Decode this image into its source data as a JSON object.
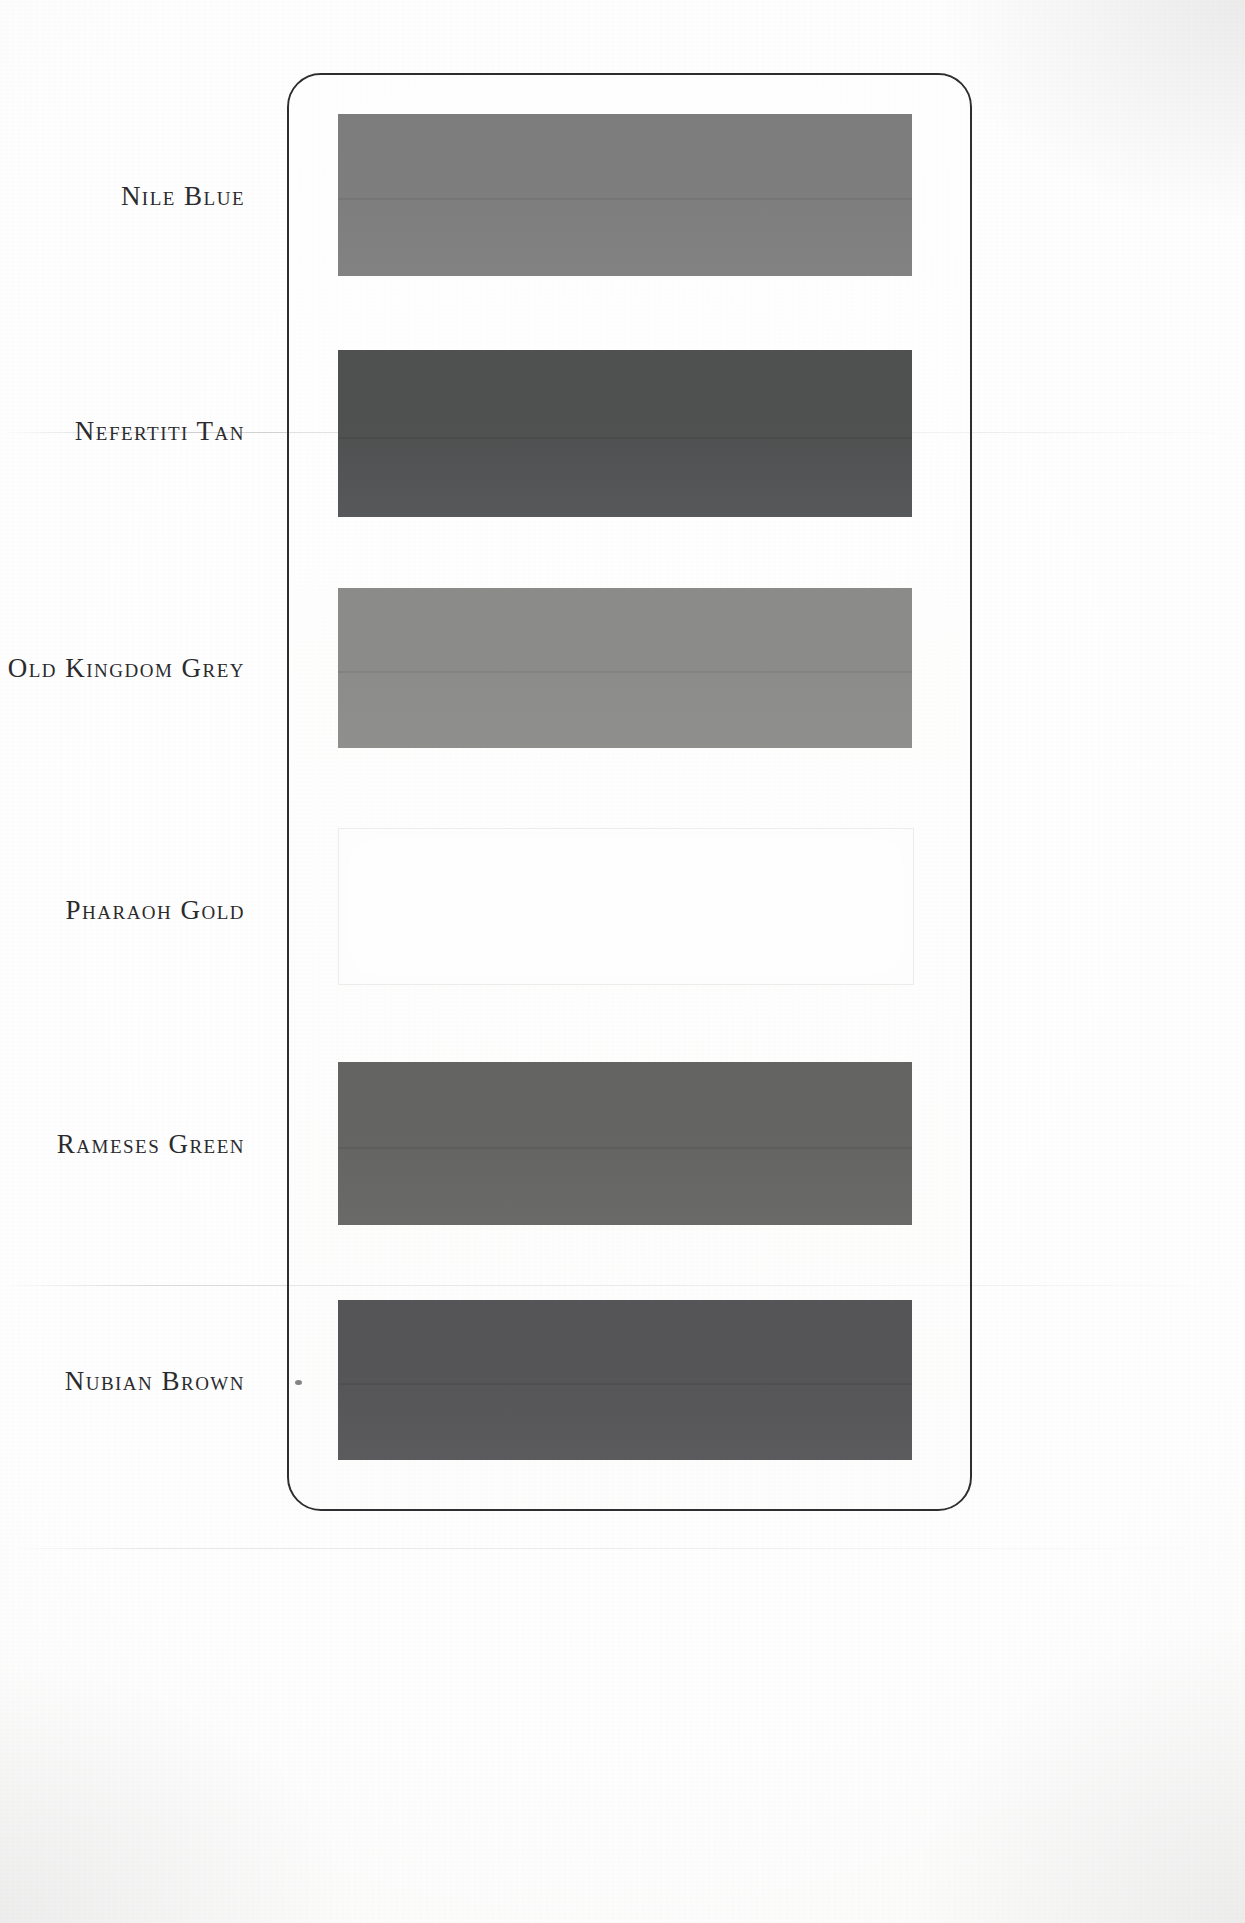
{
  "document": {
    "type": "paint-colour-sample-card",
    "title": "Egyptian Heritage Colour Card",
    "background_color": "#fdfdfc",
    "card": {
      "border_color": "#2e2e30",
      "corner_radius": 34,
      "x": 287,
      "y": 73,
      "width": 685,
      "height": 1438
    }
  },
  "swatches": [
    {
      "name": "Nile Blue",
      "label": "Nile Blue",
      "color": "#7d7d7e",
      "color_bottom": "#828283",
      "is_blank": false,
      "label_y": 183,
      "swatch_y": 114,
      "swatch_height": 162
    },
    {
      "name": "Nefertiti Tan",
      "label": "Nefertiti Tan",
      "color": "#4f5050",
      "color_bottom": "#56585a",
      "is_blank": false,
      "label_y": 418,
      "swatch_y": 350,
      "swatch_height": 167
    },
    {
      "name": "Old Kingdom Grey",
      "label": "Old Kingdom Grey",
      "color": "#8b8b8a",
      "color_bottom": "#8f8f8e",
      "is_blank": false,
      "label_y": 655,
      "swatch_y": 588,
      "swatch_height": 160
    },
    {
      "name": "Pharaoh Gold",
      "label": "Pharaoh Gold",
      "color": "#fefefe",
      "color_bottom": "#fdfdfd",
      "is_blank": true,
      "label_y": 897,
      "swatch_y": 828,
      "swatch_height": 155
    },
    {
      "name": "Rameses Green",
      "label": "Rameses Green",
      "color": "#646563",
      "color_bottom": "#6a6b69",
      "is_blank": false,
      "label_y": 1131,
      "swatch_y": 1062,
      "swatch_height": 163
    },
    {
      "name": "Nubian Brown",
      "label": "Nubian Brown",
      "color": "#555558",
      "color_bottom": "#5b5b5e",
      "is_blank": false,
      "label_y": 1368,
      "swatch_y": 1300,
      "swatch_height": 160
    }
  ]
}
